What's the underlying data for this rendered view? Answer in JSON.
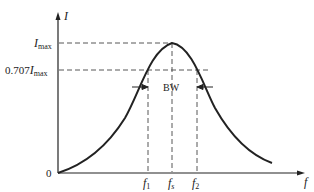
{
  "diagram": {
    "type": "resonance-curve",
    "axes": {
      "y_label": "I",
      "x_label": "f",
      "origin_label": "0"
    },
    "levels": {
      "imax": {
        "main": "I",
        "sub": "max"
      },
      "half_power": {
        "prefix": "0.707",
        "main": "I",
        "sub": "max"
      }
    },
    "frequencies": {
      "f1": {
        "main": "f",
        "sub": "1"
      },
      "fs": {
        "main": "f",
        "sub": "s"
      },
      "f2": {
        "main": "f",
        "sub": "2"
      }
    },
    "bandwidth_label": "BW",
    "colors": {
      "line": "#222222",
      "dashed": "#444444",
      "background": "#ffffff"
    }
  }
}
